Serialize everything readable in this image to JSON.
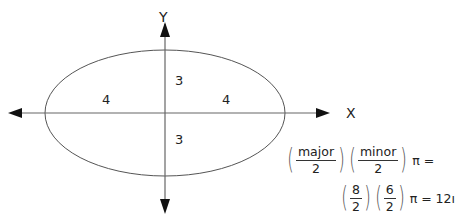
{
  "diagram": {
    "axes": {
      "x_label": "X",
      "y_label": "Y"
    },
    "ellipse": {
      "semi_major_labels": [
        "4",
        "4"
      ],
      "semi_minor_labels": [
        "3",
        "3"
      ],
      "major_axis": 8,
      "minor_axis": 6
    },
    "formula": {
      "line1": {
        "frac1_num": "major",
        "frac1_den": "2",
        "frac2_num": "minor",
        "frac2_den": "2",
        "tail": "π ="
      },
      "line2": {
        "frac1_num": "8",
        "frac1_den": "2",
        "frac2_num": "6",
        "frac2_den": "2",
        "tail": "π = 12ı"
      }
    },
    "colors": {
      "line": "#555555",
      "arrow": "#111111",
      "text": "#222222"
    }
  }
}
